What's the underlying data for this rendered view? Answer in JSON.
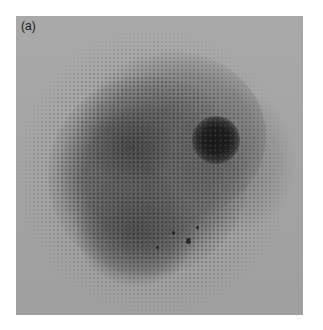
{
  "figure": {
    "panel_label": "(a)",
    "colors": {
      "background": "#a3a3a3",
      "cluster": "#5a5a5a",
      "spot": "#151515",
      "border": "#ffffff"
    }
  }
}
